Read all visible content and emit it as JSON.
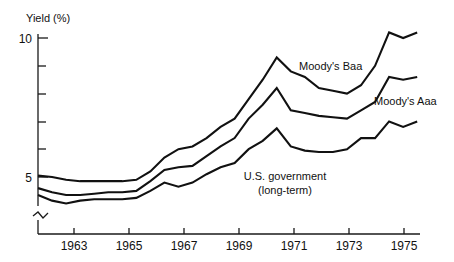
{
  "chart_data": {
    "type": "line",
    "title": "",
    "xlabel": "",
    "ylabel": "Yield (%)",
    "grid": false,
    "legend_position": "inline-annotations",
    "xlim": [
      1962,
      1975.6
    ],
    "ylim": [
      3.6,
      10.6
    ],
    "y_axis_break": true,
    "y_ticks_labeled": [
      5,
      10
    ],
    "y_tick_labels": [
      "5",
      "10"
    ],
    "y_ticks_minor": [
      6,
      7,
      8,
      9
    ],
    "x_ticks": [
      1963,
      1965,
      1967,
      1969,
      1971,
      1973,
      1975
    ],
    "x_tick_labels": [
      "1963",
      "1965",
      "1967",
      "1969",
      "1971",
      "1973",
      "1975"
    ],
    "x": [
      1962,
      1962.5,
      1963,
      1963.5,
      1964,
      1964.5,
      1965,
      1965.5,
      1966,
      1966.5,
      1967,
      1967.5,
      1968,
      1968.5,
      1969,
      1969.5,
      1970,
      1970.5,
      1971,
      1971.5,
      1972,
      1972.5,
      1973,
      1973.5,
      1974,
      1974.5,
      1975,
      1975.5
    ],
    "series": [
      {
        "name": "Moody's Baa",
        "label": "Moody's Baa",
        "values": [
          5.05,
          5.0,
          4.9,
          4.85,
          4.85,
          4.85,
          4.85,
          4.9,
          5.2,
          5.7,
          6.0,
          6.1,
          6.4,
          6.8,
          7.1,
          7.8,
          8.5,
          9.3,
          8.8,
          8.6,
          8.2,
          8.1,
          8.0,
          8.3,
          9.0,
          10.2,
          10.0,
          10.2
        ]
      },
      {
        "name": "Moody's Aaa",
        "label": "Moody's Aaa",
        "values": [
          4.6,
          4.45,
          4.35,
          4.35,
          4.4,
          4.45,
          4.45,
          4.5,
          4.85,
          5.25,
          5.35,
          5.4,
          5.75,
          6.1,
          6.4,
          7.1,
          7.6,
          8.2,
          7.4,
          7.3,
          7.2,
          7.15,
          7.1,
          7.4,
          7.7,
          8.6,
          8.5,
          8.6
        ]
      },
      {
        "name": "U.S. government (long-term)",
        "label": "U.S. government",
        "label_line2": "(long-term)",
        "values": [
          4.35,
          4.15,
          4.05,
          4.15,
          4.2,
          4.2,
          4.2,
          4.25,
          4.5,
          4.8,
          4.65,
          4.8,
          5.1,
          5.35,
          5.5,
          6.0,
          6.3,
          6.75,
          6.1,
          5.95,
          5.9,
          5.9,
          6.0,
          6.4,
          6.4,
          7.0,
          6.8,
          7.0
        ]
      }
    ]
  },
  "annotations": {
    "baa_label": "Moody's Baa",
    "aaa_label": "Moody's Aaa",
    "govt_label_line1": "U.S. government",
    "govt_label_line2": "(long-term)",
    "y_axis_title": "Yield (%)"
  },
  "colors": {
    "line": "#111111",
    "axis": "#1a1a1a",
    "background": "#ffffff"
  }
}
